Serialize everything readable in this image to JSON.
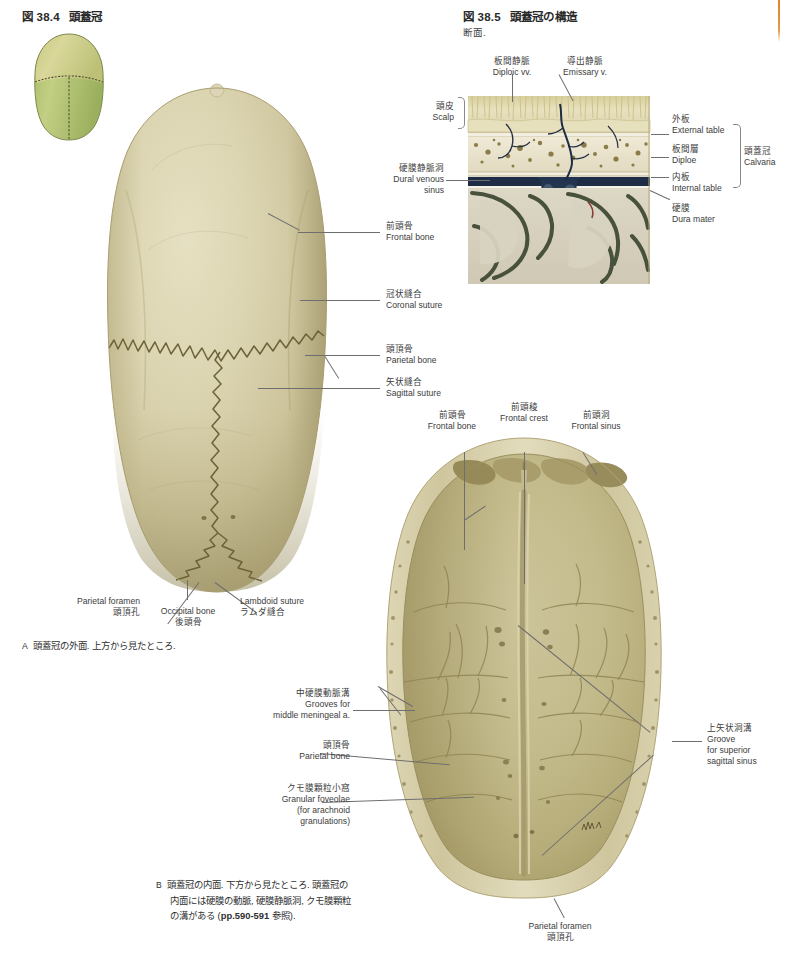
{
  "page": {
    "background": "#ffffff",
    "edge_accent_color": "#e0822a",
    "width": 786,
    "height": 959
  },
  "figures": [
    {
      "id": "fig-38-4",
      "number": "図 38.4",
      "title": "頭蓋冠"
    },
    {
      "id": "fig-38-5",
      "number": "図 38.5",
      "title": "頭蓋冠の構造",
      "subtitle": "断面."
    }
  ],
  "fig_38_5_labels": {
    "diploic_veins": {
      "jp": "板間静脈",
      "en": "Diploic vv."
    },
    "emissary_vein": {
      "jp": "導出静脈",
      "en": "Emissary v."
    },
    "scalp": {
      "jp": "頭皮",
      "en": "Scalp"
    },
    "dural_venous_sinus": {
      "jp": "硬膜静脈洞",
      "en_line1": "Dural venous",
      "en_line2": "sinus"
    },
    "external_table": {
      "jp": "外板",
      "en": "External table"
    },
    "diploe": {
      "jp": "板間層",
      "en": "Diploe"
    },
    "internal_table": {
      "jp": "内板",
      "en": "Internal table"
    },
    "dura_mater": {
      "jp": "硬膜",
      "en": "Dura mater"
    },
    "calvaria": {
      "jp": "頭蓋冠",
      "en": "Calvaria"
    }
  },
  "fig_a_labels": {
    "frontal_bone": {
      "jp": "前頭骨",
      "en": "Frontal bone"
    },
    "coronal_suture": {
      "jp": "冠状縫合",
      "en": "Coronal suture"
    },
    "parietal_bone": {
      "jp": "頭頂骨",
      "en": "Parietal bone"
    },
    "sagittal_suture": {
      "jp": "矢状縫合",
      "en": "Sagittal suture"
    },
    "parietal_foramen": {
      "en": "Parietal foramen",
      "jp": "頭頂孔"
    },
    "occipital_bone": {
      "en": "Occipital bone",
      "jp": "後頭骨"
    },
    "lambdoid_suture": {
      "en": "Lambdoid suture",
      "jp": "ラムダ縫合"
    }
  },
  "fig_b_labels": {
    "frontal_bone": {
      "jp": "前頭骨",
      "en": "Frontal bone"
    },
    "frontal_crest": {
      "jp": "前頭稜",
      "en": "Frontal crest"
    },
    "frontal_sinus": {
      "jp": "前頭洞",
      "en": "Frontal sinus"
    },
    "middle_meningeal_grooves": {
      "jp": "中硬膜動脈溝",
      "en_line1": "Grooves for",
      "en_line2": "middle meningeal a."
    },
    "parietal_bone": {
      "jp": "頭頂骨",
      "en": "Parietal bone"
    },
    "granular_foveolae": {
      "jp": "クモ膜顆粒小窩",
      "en_line1": "Granular foveolae",
      "en_line2": "(for arachnoid",
      "en_line3": "granulations)"
    },
    "superior_sagittal_sinus_groove": {
      "jp": "上矢状洞溝",
      "en_line1": "Groove",
      "en_line2": "for superior",
      "en_line3": "sagittal sinus"
    },
    "parietal_foramen": {
      "en": "Parietal foramen",
      "jp": "頭頂孔"
    }
  },
  "captions": {
    "a": {
      "marker": "A",
      "text": "頭蓋冠の外面. 上方から見たところ."
    },
    "b": {
      "marker": "B",
      "line1": "頭蓋冠の内面. 下方から見たところ. 頭蓋冠の",
      "line2": "内面には硬膜の動脈, 硬膜静脈洞, クモ膜顆粒",
      "line3_pre": "の溝がある (",
      "line3_ref": "pp.590-591",
      "line3_post": " 参照)."
    }
  },
  "art_colors": {
    "bone_light": "#ded8b8",
    "bone_mid": "#cdc49a",
    "bone_dark": "#b5ab7c",
    "bone_shadow": "#9b9167",
    "thumb_green": "#b8c77e",
    "thumb_green_dark": "#9cae63",
    "thumb_tan": "#d4cf92",
    "scalp": "#e4dcb6",
    "diploe_bg": "#e8e2cc",
    "diploe_dot": "#8a7c46",
    "sinus_blue": "#253a58",
    "brain_gray": "#d8d2c0",
    "cortex_green": "#4a5340",
    "dura_white": "#f4f2e8",
    "leader": "#6e6e6e"
  }
}
